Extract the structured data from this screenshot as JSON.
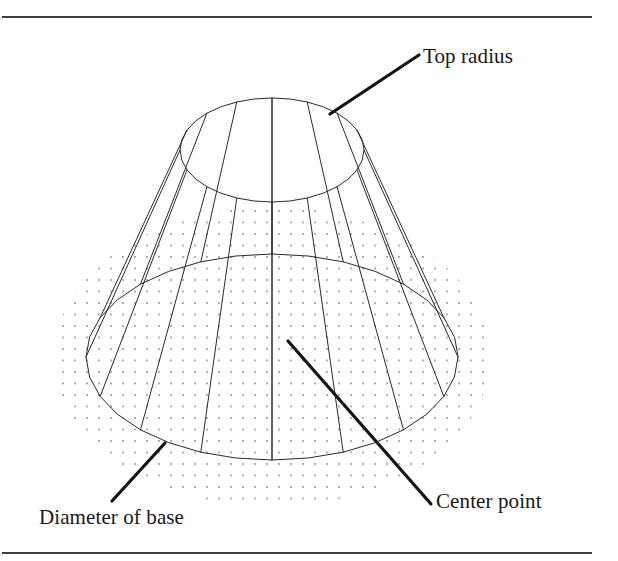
{
  "figure": {
    "background_color": "#ffffff",
    "width": 618,
    "height": 561
  },
  "frame": {
    "rule_color": "#3d3d3d",
    "top_rule_y": 17,
    "bottom_rule_y": 553,
    "rule_left_x": 2,
    "rule_right_x": 592,
    "rule_thickness": 2
  },
  "labels": {
    "top_radius": "Top radius",
    "center_point": "Center point",
    "diameter_of_base": "Diameter of base"
  },
  "callouts": [
    {
      "name": "top-radius",
      "text": "Top radius",
      "leader_from_x": 330,
      "leader_from_y": 114,
      "leader_to_x": 419,
      "leader_to_y": 55,
      "text_x": 423,
      "text_y": 46,
      "anchor_target": "top-ellipse-rim"
    },
    {
      "name": "center-point",
      "text": "Center point",
      "leader_from_x": 288,
      "leader_from_y": 341,
      "leader_to_x": 431,
      "leader_to_y": 504,
      "text_x": 436,
      "text_y": 491,
      "anchor_target": "base-center-axis"
    },
    {
      "name": "diameter-of-base",
      "text": "Diameter of base",
      "leader_from_x": 165,
      "leader_from_y": 443,
      "leader_to_x": 112,
      "leader_to_y": 501,
      "text_x": 39,
      "text_y": 507,
      "anchor_target": "base-rim-front-left"
    }
  ],
  "geometry": {
    "shape": "frustum-of-a-cone",
    "wireframe": true,
    "facet_count": 16,
    "line_color": "#2b2b2b",
    "line_width": 1,
    "leader_color": "#141414",
    "leader_width": 3.2,
    "top_ellipse": {
      "center_x": 272,
      "center_y": 150,
      "radius_x": 92,
      "radius_y": 52
    },
    "base_ellipse": {
      "center_x": 272,
      "center_y": 357,
      "radius_x": 186,
      "radius_y": 103
    },
    "axis_line": {
      "x": 272,
      "top_y": 98,
      "bottom_y": 460,
      "style": "solid-thin"
    },
    "ground_plane": {
      "pattern": "dot-grid",
      "dot_color": "#8a8a8a",
      "dot_radius": 0.9,
      "dot_spacing_x": 12,
      "dot_spacing_y": 11.5,
      "ellipse_center_x": 272,
      "ellipse_center_y": 357,
      "ellipse_radius_x": 218,
      "ellipse_radius_y": 150
    }
  }
}
